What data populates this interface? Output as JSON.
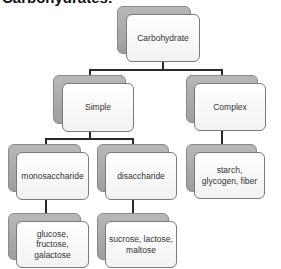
{
  "title": "Carbohydrates:",
  "nodes": {
    "root": {
      "label": "Carbohydrate"
    },
    "simple": {
      "label": "Simple"
    },
    "complex": {
      "label": "Complex"
    },
    "monosaccharide": {
      "label": "monosaccharide"
    },
    "disaccharide": {
      "label": "disaccharide"
    },
    "mono_examples": {
      "label": "glucose, fructose, galactose"
    },
    "di_examples": {
      "label": "sucrose, lactose, maltose"
    },
    "complex_examples": {
      "label": "starch, glycogen, fiber"
    }
  },
  "colors": {
    "box_fill": "#f7f7f7",
    "shadow_fill": "#a9a9a9",
    "connector": "#2a2a2a"
  }
}
